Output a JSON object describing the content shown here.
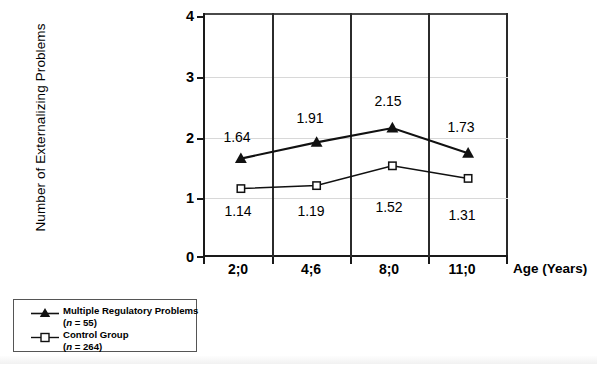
{
  "chart_data": {
    "type": "line",
    "title": "",
    "xlabel": "Age (Years)",
    "ylabel": "Number of Externalizing Problems",
    "categories": [
      "2;0",
      "4;6",
      "8;0",
      "11;0"
    ],
    "ylim": [
      0,
      4
    ],
    "yticks": [
      "0",
      "1",
      "2",
      "3",
      "4"
    ],
    "grid": "both",
    "legend_position": "below-left-outside",
    "series": [
      {
        "name": "Multiple Regulatory Problems",
        "n_label": "(n = 55)",
        "marker": "filled-triangle",
        "color": "#111111",
        "values": [
          1.64,
          1.91,
          2.15,
          1.73
        ],
        "labels": [
          "1.64",
          "1.91",
          "2.15",
          "1.73"
        ],
        "label_side": [
          "above",
          "above",
          "above",
          "above"
        ]
      },
      {
        "name": "Control Group",
        "n_label": "(n = 264)",
        "marker": "open-square",
        "color": "#111111",
        "values": [
          1.14,
          1.19,
          1.52,
          1.31
        ],
        "labels": [
          "1.14",
          "1.19",
          "1.52",
          "1.31"
        ],
        "label_side": [
          "below",
          "below",
          "below",
          "below"
        ]
      }
    ]
  },
  "axes": {
    "y_title": "Number of Externalizing Problems",
    "x_title": "Age (Years)",
    "y_tick_0": "0",
    "y_tick_1": "1",
    "y_tick_2": "2",
    "y_tick_3": "3",
    "y_tick_4": "4",
    "x_tick_0": "2;0",
    "x_tick_1": "4;6",
    "x_tick_2": "8;0",
    "x_tick_3": "11;0"
  },
  "data_labels": {
    "treatment": [
      "1.64",
      "1.91",
      "2.15",
      "1.73"
    ],
    "control": [
      "1.14",
      "1.19",
      "1.52",
      "1.31"
    ]
  },
  "legend": {
    "entry1_name": "Multiple Regulatory Problems",
    "entry1_n": "(n = 55)",
    "entry1_n_prefix": "(",
    "entry1_n_var": "n",
    "entry1_n_suffix": " = 55)",
    "entry2_name": "Control Group",
    "entry2_n": "(n = 264)",
    "entry2_n_prefix": "(",
    "entry2_n_var": "n",
    "entry2_n_suffix": " = 264)"
  },
  "colors": {
    "line": "#111111",
    "frame": "#1a1a1a",
    "grid": "#d8d8d8"
  }
}
